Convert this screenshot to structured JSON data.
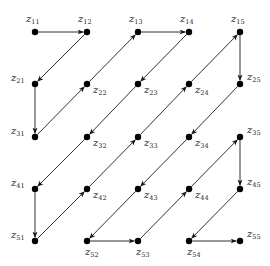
{
  "grid": {
    "rows": 5,
    "cols": 5,
    "x": [
      35,
      87,
      138,
      189,
      240
    ],
    "y": [
      32,
      84,
      137,
      189,
      241
    ]
  },
  "colors": {
    "edge": "#1a1a1a",
    "node": "#000000",
    "label": "#222222"
  },
  "nodes": [
    {
      "id": "z11",
      "base": "z",
      "sub": "11",
      "r": 0,
      "c": 0,
      "label_pos": "above"
    },
    {
      "id": "z12",
      "base": "z",
      "sub": "12",
      "r": 0,
      "c": 1,
      "label_pos": "above"
    },
    {
      "id": "z13",
      "base": "z",
      "sub": "13",
      "r": 0,
      "c": 2,
      "label_pos": "above"
    },
    {
      "id": "z14",
      "base": "z",
      "sub": "14",
      "r": 0,
      "c": 3,
      "label_pos": "above"
    },
    {
      "id": "z15",
      "base": "z",
      "sub": "15",
      "r": 0,
      "c": 4,
      "label_pos": "above"
    },
    {
      "id": "z21",
      "base": "z",
      "sub": "21",
      "r": 1,
      "c": 0,
      "label_pos": "left"
    },
    {
      "id": "z22",
      "base": "z",
      "sub": "22",
      "r": 1,
      "c": 1,
      "label_pos": "below-right"
    },
    {
      "id": "z23",
      "base": "z",
      "sub": "23",
      "r": 1,
      "c": 2,
      "label_pos": "below-right"
    },
    {
      "id": "z24",
      "base": "z",
      "sub": "24",
      "r": 1,
      "c": 3,
      "label_pos": "below-right"
    },
    {
      "id": "z25",
      "base": "z",
      "sub": "25",
      "r": 1,
      "c": 4,
      "label_pos": "right"
    },
    {
      "id": "z31",
      "base": "z",
      "sub": "31",
      "r": 2,
      "c": 0,
      "label_pos": "left"
    },
    {
      "id": "z32",
      "base": "z",
      "sub": "32",
      "r": 2,
      "c": 1,
      "label_pos": "below-right"
    },
    {
      "id": "z33",
      "base": "z",
      "sub": "33",
      "r": 2,
      "c": 2,
      "label_pos": "below-right"
    },
    {
      "id": "z34",
      "base": "z",
      "sub": "34",
      "r": 2,
      "c": 3,
      "label_pos": "below-right"
    },
    {
      "id": "z35",
      "base": "z",
      "sub": "35",
      "r": 2,
      "c": 4,
      "label_pos": "right"
    },
    {
      "id": "z41",
      "base": "z",
      "sub": "41",
      "r": 3,
      "c": 0,
      "label_pos": "left"
    },
    {
      "id": "z42",
      "base": "z",
      "sub": "42",
      "r": 3,
      "c": 1,
      "label_pos": "below-right"
    },
    {
      "id": "z43",
      "base": "z",
      "sub": "43",
      "r": 3,
      "c": 2,
      "label_pos": "below-right"
    },
    {
      "id": "z44",
      "base": "z",
      "sub": "44",
      "r": 3,
      "c": 3,
      "label_pos": "below-right"
    },
    {
      "id": "z45",
      "base": "z",
      "sub": "45",
      "r": 3,
      "c": 4,
      "label_pos": "right"
    },
    {
      "id": "z51",
      "base": "z",
      "sub": "51",
      "r": 4,
      "c": 0,
      "label_pos": "left"
    },
    {
      "id": "z52",
      "base": "z",
      "sub": "52",
      "r": 4,
      "c": 1,
      "label_pos": "below"
    },
    {
      "id": "z53",
      "base": "z",
      "sub": "53",
      "r": 4,
      "c": 2,
      "label_pos": "below"
    },
    {
      "id": "z54",
      "base": "z",
      "sub": "54",
      "r": 4,
      "c": 3,
      "label_pos": "below"
    },
    {
      "id": "z55",
      "base": "z",
      "sub": "55",
      "r": 4,
      "c": 4,
      "label_pos": "right"
    }
  ],
  "path": [
    "z11",
    "z12",
    "z21",
    "z31",
    "z22",
    "z13",
    "z14",
    "z23",
    "z32",
    "z41",
    "z51",
    "z42",
    "z33",
    "z24",
    "z15",
    "z25",
    "z34",
    "z43",
    "z52",
    "z53",
    "z44",
    "z35",
    "z45",
    "z54",
    "z55"
  ],
  "arrow_heads": {
    "z11>z12": "end",
    "z12>z21": "end",
    "z21>z31": "end",
    "z31>z22": "end",
    "z22>z13": "end",
    "z13>z14": "end",
    "z14>z23": "mid",
    "z23>z32": "mid",
    "z32>z41": "end",
    "z41>z51": "end",
    "z51>z42": "end",
    "z42>z33": "mid",
    "z33>z24": "mid",
    "z24>z15": "end",
    "z15>z25": "end",
    "z25>z34": "end",
    "z34>z43": "mid",
    "z43>z52": "end",
    "z52>z53": "end",
    "z53>z44": "end",
    "z44>z35": "end",
    "z35>z45": "end",
    "z45>z54": "end",
    "z54>z55": "end"
  }
}
